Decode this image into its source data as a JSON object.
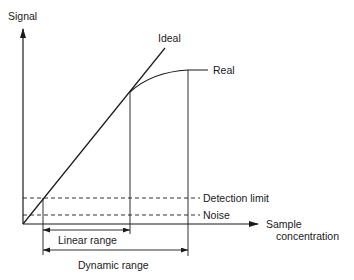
{
  "diagram": {
    "colors": {
      "line": "#1a1a1a",
      "background": "#ffffff"
    },
    "axes": {
      "y_label": "Signal",
      "x_label_line1": "Sample",
      "x_label_line2": "concentration"
    },
    "curves": {
      "ideal_label": "Ideal",
      "real_label": "Real"
    },
    "levels": {
      "detection_limit_label": "Detection limit",
      "noise_label": "Noise"
    },
    "ranges": {
      "linear_label": "Linear range",
      "dynamic_label": "Dynamic range"
    }
  }
}
